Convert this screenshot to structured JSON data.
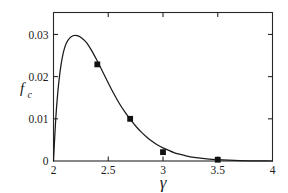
{
  "chart_data": {
    "type": "line",
    "title": "",
    "xlabel": "γ",
    "ylabel": "f_c",
    "ylabel_main": "f",
    "ylabel_sub": "c",
    "xlim": [
      2,
      4
    ],
    "ylim": [
      0,
      0.0352
    ],
    "grid": false,
    "legend": null,
    "xticks": [
      2,
      2.5,
      3,
      3.5,
      4
    ],
    "xtick_labels": [
      "2",
      "2.5",
      "3",
      "3.5",
      "4"
    ],
    "yticks": [
      0,
      0.01,
      0.02,
      0.03
    ],
    "ytick_labels": [
      "0",
      "0.01",
      "0.02",
      "0.03"
    ],
    "series": [
      {
        "name": "f_c curve",
        "style": "line",
        "color": "#1a1a1a",
        "x": [
          2.0,
          2.02,
          2.04,
          2.06,
          2.08,
          2.1,
          2.12,
          2.15,
          2.18,
          2.2,
          2.23,
          2.26,
          2.3,
          2.35,
          2.4,
          2.45,
          2.5,
          2.55,
          2.6,
          2.65,
          2.7,
          2.75,
          2.8,
          2.85,
          2.9,
          2.95,
          3.0,
          3.1,
          3.2,
          3.3,
          3.4,
          3.5,
          3.6,
          3.7,
          3.8,
          3.9,
          4.0
        ],
        "y": [
          0.0,
          0.0098,
          0.0165,
          0.0212,
          0.0245,
          0.0267,
          0.0281,
          0.0292,
          0.0297,
          0.0298,
          0.0296,
          0.0291,
          0.0281,
          0.0261,
          0.0237,
          0.0211,
          0.0185,
          0.016,
          0.0137,
          0.0117,
          0.0099,
          0.0083,
          0.0069,
          0.0057,
          0.0047,
          0.0038,
          0.0031,
          0.002,
          0.0013,
          0.0008,
          0.0005,
          0.0003,
          0.00018,
          0.0001,
          5e-05,
          2e-05,
          0.0
        ]
      },
      {
        "name": "data points",
        "style": "markers",
        "marker": "square",
        "color": "#111111",
        "x": [
          2.4,
          2.7,
          3.0,
          3.5
        ],
        "y": [
          0.0229,
          0.01,
          0.0021,
          0.0003
        ]
      }
    ]
  },
  "axes": {
    "frame_color": "#262626",
    "tick_direction": "in"
  }
}
